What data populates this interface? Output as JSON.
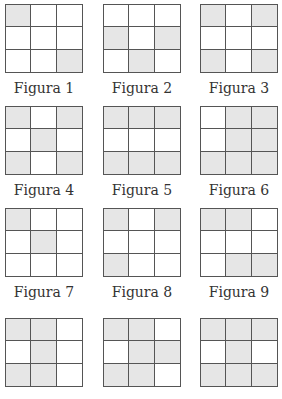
{
  "figures": [
    {
      "label": "Figura 1",
      "cells": [
        1,
        0,
        0,
        0,
        0,
        0,
        0,
        0,
        1
      ]
    },
    {
      "label": "Figura 2",
      "cells": [
        0,
        0,
        0,
        1,
        0,
        1,
        0,
        1,
        0
      ]
    },
    {
      "label": "Figura 3",
      "cells": [
        1,
        0,
        1,
        0,
        0,
        0,
        1,
        0,
        1
      ]
    },
    {
      "label": "Figura 4",
      "cells": [
        1,
        0,
        1,
        0,
        1,
        0,
        1,
        0,
        1
      ]
    },
    {
      "label": "Figura 5",
      "cells": [
        1,
        1,
        1,
        0,
        0,
        0,
        1,
        1,
        1
      ]
    },
    {
      "label": "Figura 6",
      "cells": [
        0,
        1,
        1,
        0,
        1,
        1,
        1,
        1,
        1
      ]
    },
    {
      "label": "Figura 7",
      "cells": [
        1,
        0,
        0,
        0,
        1,
        0,
        0,
        0,
        0
      ]
    },
    {
      "label": "Figura 8",
      "cells": [
        1,
        0,
        1,
        0,
        0,
        0,
        1,
        0,
        0
      ]
    },
    {
      "label": "Figura 9",
      "cells": [
        1,
        1,
        0,
        0,
        0,
        0,
        0,
        1,
        1
      ]
    },
    {
      "label": "",
      "cells": [
        1,
        1,
        0,
        0,
        1,
        0,
        1,
        1,
        0
      ]
    },
    {
      "label": "",
      "cells": [
        1,
        1,
        0,
        0,
        1,
        1,
        1,
        1,
        0
      ]
    },
    {
      "label": "",
      "cells": [
        1,
        1,
        1,
        0,
        1,
        0,
        1,
        1,
        1
      ]
    }
  ],
  "colors": {
    "shaded": "#e6e6e6",
    "line": "#555555",
    "background": "#ffffff"
  }
}
